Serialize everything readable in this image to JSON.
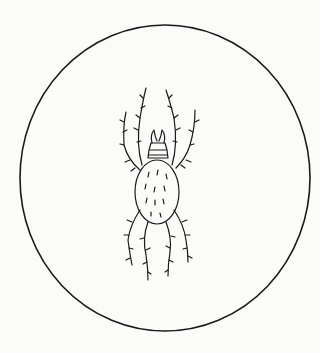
{
  "figure": {
    "stroke_color": "#1a1a1a",
    "background_color": "#fbfbf9"
  }
}
